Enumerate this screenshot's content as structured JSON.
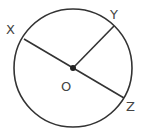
{
  "diagram": {
    "type": "circle-geometry",
    "stroke_color": "#333333",
    "circle": {
      "cx": 73,
      "cy": 68,
      "r": 59
    },
    "center": {
      "label": "O",
      "x": 73,
      "y": 68,
      "label_x": 61,
      "label_y": 91
    },
    "points": [
      {
        "label": "X",
        "x": 24,
        "y": 39,
        "label_x": 6,
        "label_y": 34
      },
      {
        "label": "Y",
        "x": 114,
        "y": 26,
        "label_x": 114,
        "label_y": 19
      },
      {
        "label": "Z",
        "x": 124,
        "y": 98,
        "label_x": 127,
        "label_y": 111
      }
    ],
    "segments": [
      {
        "name": "diameter-XZ",
        "from": "X",
        "to": "Z"
      },
      {
        "name": "radius-OY",
        "from": "O",
        "to": "Y"
      }
    ]
  }
}
